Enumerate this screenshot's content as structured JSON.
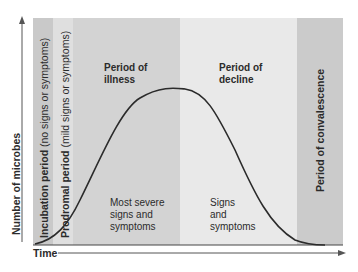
{
  "axes": {
    "y_label": "Number of microbes",
    "x_label": "Time"
  },
  "periods": [
    {
      "name": "Incubation period",
      "note": "(no signs or symptoms)",
      "color": "#c9c9c9"
    },
    {
      "name": "Prodromal period",
      "note": "(mild signs or symptoms)",
      "color": "#dedede"
    },
    {
      "name": "Period of illness",
      "line1": "Period of",
      "line2": "illness",
      "desc": [
        "Most severe",
        "signs and",
        "symptoms"
      ],
      "color": "#d2d2d2"
    },
    {
      "name": "Period of decline",
      "line1": "Period of",
      "line2": "decline",
      "desc": [
        "Signs",
        "and",
        "symptoms"
      ],
      "color": "#e8e8e8"
    },
    {
      "name": "Period of convalescence",
      "color": "#cbcbcb"
    }
  ]
}
